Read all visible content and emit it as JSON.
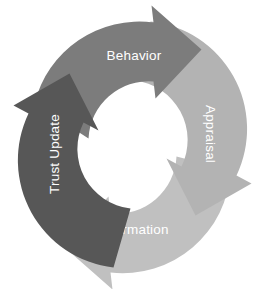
{
  "diagram": {
    "type": "cyclical-process",
    "title": "",
    "background_color": "#ffffff",
    "direction": "clockwise",
    "label_color": "#ffffff",
    "stages": [
      {
        "id": "behavior",
        "label": "Behavior",
        "position": "top",
        "color": "#7c7c7c",
        "order": 1
      },
      {
        "id": "appraisal",
        "label": "Appraisal",
        "position": "right",
        "color": "#b3b3b3",
        "order": 2
      },
      {
        "id": "disconfirmation",
        "label": "(Dis)confirmation",
        "position": "bottom",
        "color": "#c0c0c0",
        "order": 3
      },
      {
        "id": "trust-update",
        "label": "Trust Update",
        "position": "left",
        "color": "#575757",
        "order": 4
      }
    ]
  }
}
